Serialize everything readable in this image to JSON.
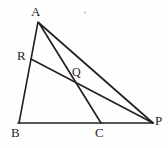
{
  "figure": {
    "background_color": "#fefefe",
    "stroke_color": "#26211f",
    "label_color": "#241f1d",
    "width": 168,
    "height": 148,
    "points": {
      "A": {
        "label": "A",
        "x": 38,
        "y": 21
      },
      "R": {
        "label": "R",
        "x": 31,
        "y": 59
      },
      "Q": {
        "label": "Q",
        "x": 81,
        "y": 84
      },
      "B": {
        "label": "B",
        "x": 19,
        "y": 123
      },
      "C": {
        "label": "C",
        "x": 101,
        "y": 123
      },
      "P": {
        "label": "P",
        "x": 153,
        "y": 123
      }
    },
    "segments": [
      {
        "name": "AB",
        "from": "A",
        "to": "B"
      },
      {
        "name": "BP",
        "from": "B",
        "to": "P"
      },
      {
        "name": "AP",
        "from": "A",
        "to": "P"
      },
      {
        "name": "AC",
        "from": "A",
        "to": "C"
      },
      {
        "name": "RP",
        "from": "R",
        "to": "P"
      }
    ]
  }
}
